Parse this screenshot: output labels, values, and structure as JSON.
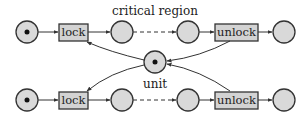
{
  "labels": {
    "critical_region": "critical region",
    "unit": "unit"
  },
  "transitions": {
    "top_lock": "lock",
    "top_unlock": "unlock",
    "bottom_lock": "lock",
    "bottom_unlock": "unlock"
  },
  "colors": {
    "place_fill": "#d9d9d9",
    "transition_fill": "#d3d3d3",
    "stroke": "#333333",
    "token": "#111111"
  }
}
